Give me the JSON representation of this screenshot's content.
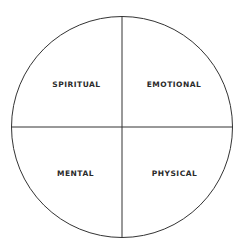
{
  "diagram": {
    "type": "quadrant-circle",
    "circle": {
      "cx": 122,
      "cy": 127,
      "r": 110.5,
      "stroke": "#333333",
      "fill": "#ffffff"
    },
    "quadrants": {
      "top_left": {
        "label": "SPIRITUAL"
      },
      "top_right": {
        "label": "EMOTIONAL"
      },
      "bottom_left": {
        "label": "MENTAL"
      },
      "bottom_right": {
        "label": "PHYSICAL"
      }
    }
  }
}
